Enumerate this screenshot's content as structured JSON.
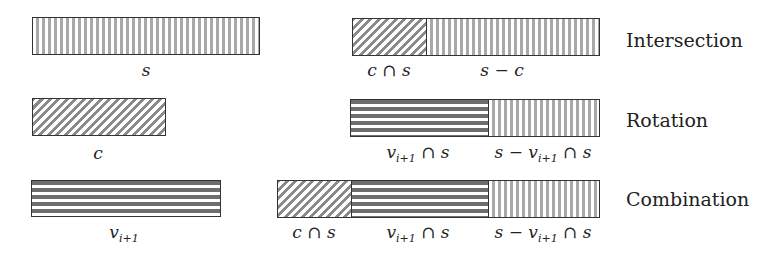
{
  "diagram": {
    "rows": [
      {
        "name": "Intersection",
        "left_bar": {
          "label": "s",
          "pattern": "vertical"
        },
        "right_bar": {
          "segments": [
            {
              "label": "c ∩ s",
              "pattern": "diagonal"
            },
            {
              "label": "s − c",
              "pattern": "vertical"
            }
          ]
        }
      },
      {
        "name": "Rotation",
        "left_bar": {
          "label": "c",
          "pattern": "diagonal"
        },
        "right_bar": {
          "segments": [
            {
              "label": "v",
              "sub": "i+1",
              "suffix": " ∩ s",
              "pattern": "horizontal"
            },
            {
              "label": "s − v",
              "sub": "i+1",
              "suffix": " ∩ s",
              "pattern": "vertical"
            }
          ]
        }
      },
      {
        "name": "Combination",
        "left_bar": {
          "label": "v",
          "sub": "i+1",
          "pattern": "horizontal"
        },
        "right_bar": {
          "segments": [
            {
              "label": "c ∩ s",
              "pattern": "diagonal"
            },
            {
              "label": "v",
              "sub": "i+1",
              "suffix": " ∩ s",
              "pattern": "horizontal"
            },
            {
              "label": "s − v",
              "sub": "i+1",
              "suffix": " ∩ s",
              "pattern": "vertical"
            }
          ]
        }
      }
    ],
    "colors": {
      "border": "#333333",
      "vertical_stripe": "#a8a8a8",
      "horizontal_stripe": "#6e6e6e",
      "diagonal_stripe": "#8a8a8a"
    }
  }
}
